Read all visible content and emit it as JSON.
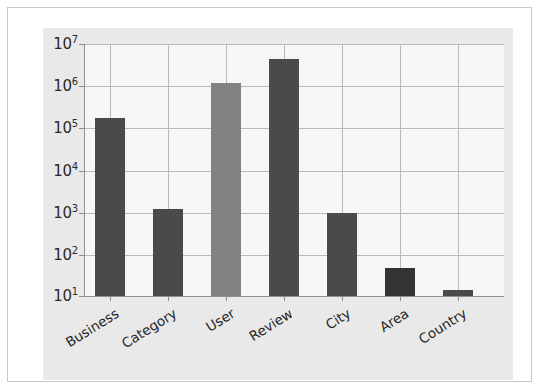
{
  "chart_data": {
    "type": "bar",
    "title": "",
    "xlabel": "",
    "ylabel": "",
    "yscale": "log",
    "ylim": [
      10,
      10000000
    ],
    "grid": true,
    "legend": "none",
    "categories": [
      "Business",
      "Category",
      "User",
      "Review",
      "City",
      "Area",
      "Country"
    ],
    "values": [
      180000,
      1200,
      1200000,
      4500000,
      1000,
      50,
      15
    ],
    "ytick_labels": [
      "10",
      "10",
      "10",
      "10",
      "10",
      "10",
      "10"
    ],
    "ytick_exponents": [
      "7",
      "6",
      "5",
      "4",
      "3",
      "2",
      "1"
    ],
    "ytick_values": [
      10000000,
      1000000,
      100000,
      10000,
      1000,
      100,
      10
    ],
    "bar_colors": [
      "#4a4a4a",
      "#4a4a4a",
      "#828282",
      "#4a4a4a",
      "#4a4a4a",
      "#333333",
      "#4a4a4a"
    ]
  },
  "colors": {
    "page_background": "#ffffff",
    "page_border": "#c8c8c8",
    "figure_background": "#e9e9e9",
    "plot_background": "#f6f6f6",
    "gridline": "#b9b9b9",
    "axis": "#8f8f8f",
    "tick_text": "#262626",
    "bar_dark": "#4a4a4a",
    "bar_light": "#828282"
  }
}
